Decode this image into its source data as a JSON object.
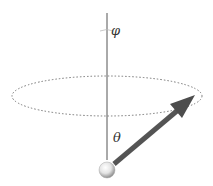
{
  "diagram": {
    "labels": {
      "phi": "φ",
      "theta": "θ"
    },
    "colors": {
      "axis": "#555555",
      "orbit": "#777777",
      "arrow": "#555555",
      "sphere_light": "#ffffff",
      "sphere_dark": "#9a9a9a",
      "text": "#333333"
    },
    "elements": [
      "vertical-axis",
      "dotted-orbit-ellipse",
      "vector-arrow",
      "origin-sphere",
      "phi-rotation-arc"
    ]
  }
}
